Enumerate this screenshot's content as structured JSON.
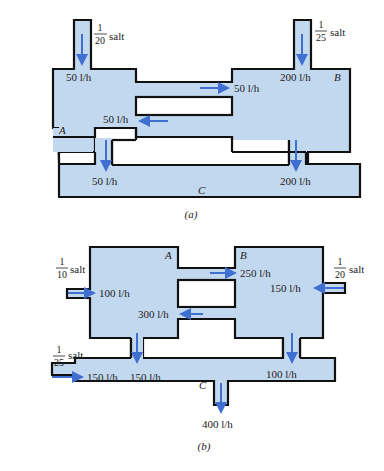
{
  "figure_a": {
    "caption": "(a)",
    "tanks": {
      "A": "A",
      "B": "B",
      "C": "C"
    },
    "inlet_A": {
      "num": "1",
      "den": "20",
      "unit": "salt",
      "flow": "50 l/h"
    },
    "inlet_B": {
      "num": "1",
      "den": "25",
      "unit": "salt",
      "flow": "200 l/h"
    },
    "pipe_A_to_B": "50 l/h",
    "pipe_B_to_A": "50 l/h",
    "pipe_A_to_C": "50 l/h",
    "pipe_B_to_C": "200 l/h"
  },
  "figure_b": {
    "caption": "(b)",
    "tanks": {
      "A": "A",
      "B": "B",
      "C": "C"
    },
    "inlet_A": {
      "num": "1",
      "den": "10",
      "unit": "salt",
      "flow": "100 l/h"
    },
    "inlet_B": {
      "num": "1",
      "den": "20",
      "unit": "salt",
      "flow": "150 l/h"
    },
    "inlet_C": {
      "num": "1",
      "den": "25",
      "unit": "salt",
      "flow": "150 l/h"
    },
    "pipe_A_to_B": "250 l/h",
    "pipe_B_to_A": "300 l/h",
    "pipe_A_to_C": "150 l/h",
    "pipe_B_to_C": "100 l/h",
    "outlet_C": "400 l/h"
  },
  "colors": {
    "fluid": "#c2d8ef",
    "arrow": "#3f6fd1",
    "outline": "#111111"
  }
}
